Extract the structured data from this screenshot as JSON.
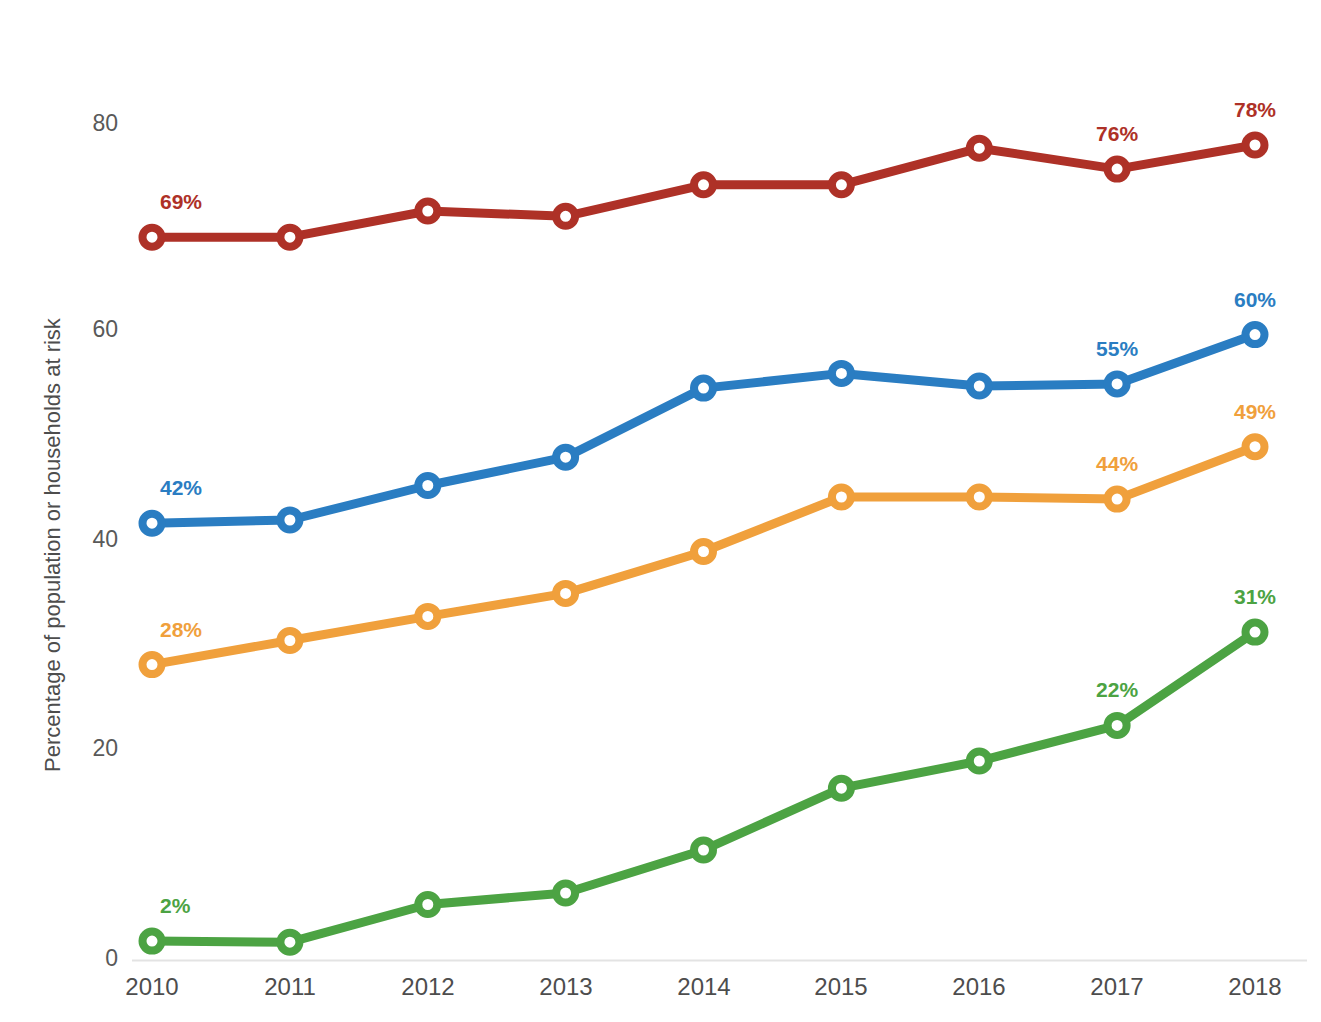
{
  "chart_data": {
    "type": "line",
    "title": "",
    "subtitle": "",
    "xlabel": "",
    "ylabel": "Percentage of population or households at risk",
    "categories": [
      "2010",
      "2011",
      "2012",
      "2013",
      "2014",
      "2015",
      "2016",
      "2017",
      "2018"
    ],
    "x": [
      2010,
      2011,
      2012,
      2013,
      2014,
      2015,
      2016,
      2017,
      2018
    ],
    "ylim": [
      0,
      80
    ],
    "xlim": [
      2010,
      2018
    ],
    "y_ticks": [
      0,
      20,
      40,
      60,
      80
    ],
    "y_tick_labels": [
      "0",
      "20",
      "40",
      "60",
      "80"
    ],
    "grid": false,
    "baseline_only": true,
    "legend": "none",
    "legend_position": "none",
    "marker": "circle-open",
    "series": [
      {
        "name": "series-red",
        "color": "#AE3127",
        "label_color": "#AE3127",
        "values": [
          69,
          69,
          71.5,
          71,
          74,
          74,
          77.5,
          75.5,
          77.8
        ],
        "annotations": [
          {
            "index": 0,
            "text": "69%",
            "position": "above-right"
          },
          {
            "index": 7,
            "text": "76%",
            "position": "above"
          },
          {
            "index": 8,
            "text": "78%",
            "position": "above"
          }
        ]
      },
      {
        "name": "series-blue",
        "color": "#2A7DC2",
        "label_color": "#2A7DC2",
        "values": [
          41.7,
          42,
          45.3,
          48,
          54.6,
          56,
          54.8,
          55,
          59.7
        ],
        "annotations": [
          {
            "index": 0,
            "text": "42%",
            "position": "above-right"
          },
          {
            "index": 7,
            "text": "55%",
            "position": "above"
          },
          {
            "index": 8,
            "text": "60%",
            "position": "above"
          }
        ]
      },
      {
        "name": "series-orange",
        "color": "#F0A03C",
        "label_color": "#F0A03C",
        "values": [
          28.2,
          30.5,
          32.8,
          35,
          39,
          44.2,
          44.2,
          44,
          49
        ],
        "annotations": [
          {
            "index": 0,
            "text": "28%",
            "position": "above-right"
          },
          {
            "index": 7,
            "text": "44%",
            "position": "above"
          },
          {
            "index": 8,
            "text": "49%",
            "position": "above"
          }
        ]
      },
      {
        "name": "series-green",
        "color": "#4CA343",
        "label_color": "#4CA343",
        "values": [
          1.8,
          1.7,
          5.3,
          6.4,
          10.5,
          16.4,
          19,
          22.4,
          31.3
        ],
        "annotations": [
          {
            "index": 0,
            "text": "2%",
            "position": "above-right"
          },
          {
            "index": 7,
            "text": "22%",
            "position": "above"
          },
          {
            "index": 8,
            "text": "31%",
            "position": "above"
          }
        ]
      }
    ]
  },
  "axes": {
    "y_title": "Percentage of population or households at risk",
    "y_tick_0": "0",
    "y_tick_20": "20",
    "y_tick_40": "40",
    "y_tick_60": "60",
    "y_tick_80": "80",
    "x_tick_2010": "2010",
    "x_tick_2011": "2011",
    "x_tick_2012": "2012",
    "x_tick_2013": "2013",
    "x_tick_2014": "2014",
    "x_tick_2015": "2015",
    "x_tick_2016": "2016",
    "x_tick_2017": "2017",
    "x_tick_2018": "2018"
  },
  "labels": {
    "red_first": "69%",
    "red_2017": "76%",
    "red_2018": "78%",
    "blue_first": "42%",
    "blue_2017": "55%",
    "blue_2018": "60%",
    "orange_first": "28%",
    "orange_2017": "44%",
    "orange_2018": "49%",
    "green_first": "2%",
    "green_2017": "22%",
    "green_2018": "31%"
  },
  "colors": {
    "red": "#AE3127",
    "blue": "#2A7DC2",
    "orange": "#F0A03C",
    "green": "#4CA343",
    "axis_text": "#4d4d4d",
    "baseline": "#e0e0e0",
    "background": "#ffffff"
  },
  "footnote": {
    "text": ""
  }
}
